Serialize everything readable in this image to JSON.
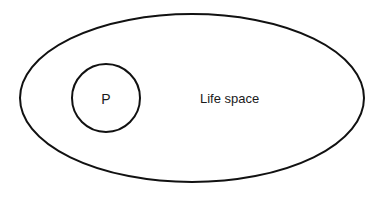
{
  "diagram": {
    "colors": {
      "stroke": "#111111",
      "background": "#ffffff",
      "text": "#1a1a1a"
    },
    "life_space": {
      "label": "Life space"
    },
    "person": {
      "label": "P"
    }
  }
}
